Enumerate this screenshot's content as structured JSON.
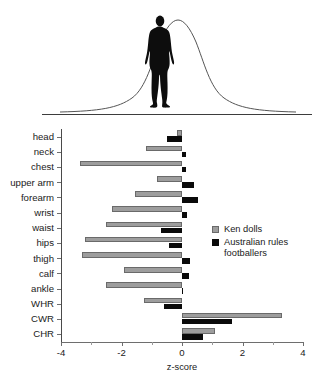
{
  "figure": {
    "top_panel": {
      "curve_name": "normal-distribution-curve",
      "figure_name": "male-body-silhouette"
    }
  },
  "legend": {
    "position": "right-middle",
    "entries": [
      {
        "label": "Ken dolls",
        "color": "#9d9d9d"
      },
      {
        "label": "Australian rules footballers",
        "color": "#0a0a0a"
      }
    ]
  },
  "chart_data": {
    "type": "bar",
    "orientation": "horizontal",
    "title": "",
    "xlabel": "z-score",
    "ylabel": "",
    "xlim": [
      -4,
      4
    ],
    "xticks": [
      -4,
      -2,
      0,
      2,
      4
    ],
    "xticklabels": [
      "-4",
      "-2",
      "0",
      "2",
      "4"
    ],
    "grid": false,
    "categories": [
      "head",
      "neck",
      "chest",
      "upper arm",
      "forearm",
      "wrist",
      "waist",
      "hips",
      "thigh",
      "calf",
      "ankle",
      "WHR",
      "CWR",
      "CHR"
    ],
    "series": [
      {
        "name": "Ken dolls",
        "color": "#9d9d9d",
        "values": [
          -0.17,
          -1.18,
          -3.37,
          -0.82,
          -1.55,
          -2.32,
          -2.52,
          -3.22,
          -3.3,
          -1.93,
          -2.5,
          -1.25,
          3.32,
          1.1
        ]
      },
      {
        "name": "Australian rules footballers",
        "color": "#0a0a0a",
        "values": [
          -0.48,
          0.12,
          0.13,
          0.4,
          0.53,
          0.15,
          -0.68,
          -0.42,
          0.28,
          0.22,
          0.04,
          -0.58,
          1.65,
          0.68
        ]
      }
    ]
  }
}
